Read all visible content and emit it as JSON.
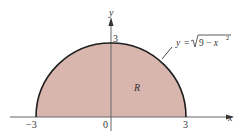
{
  "figure": {
    "type": "region-under-curve",
    "region_label": "R",
    "curve_equation": {
      "lhs": "y",
      "equals": "=",
      "radicand": "9 − x",
      "exponent": "2"
    },
    "axes": {
      "x_label": "x",
      "y_label": "y",
      "x_ticks": [
        "−3",
        "0",
        "3"
      ],
      "y_ticks": [
        "3"
      ]
    },
    "colors": {
      "fill": "#d9b6ad",
      "curve": "#1e1e1e",
      "axis": "#555555",
      "text": "#333333"
    }
  }
}
